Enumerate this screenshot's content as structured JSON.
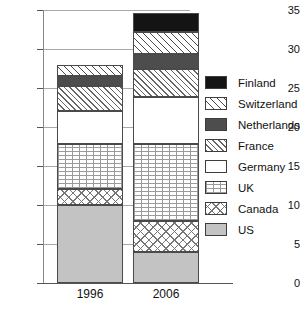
{
  "chart_data": {
    "type": "bar",
    "subtype": "stacked-vertical",
    "title": "",
    "xlabel": "",
    "ylabel": "",
    "categories": [
      "1996",
      "2006"
    ],
    "ylim": [
      0,
      35
    ],
    "yticks": [
      0,
      5,
      10,
      15,
      20,
      25,
      30,
      35
    ],
    "grid": true,
    "legend_position": "right",
    "stack_order_bottom_to_top": [
      "US",
      "Canada",
      "UK",
      "Germany",
      "France",
      "Netherlands",
      "Switzerland",
      "Finland"
    ],
    "series": [
      {
        "name": "US",
        "values": [
          10.0,
          4.0
        ]
      },
      {
        "name": "Canada",
        "values": [
          2.0,
          4.0
        ]
      },
      {
        "name": "UK",
        "values": [
          5.8,
          9.8
        ]
      },
      {
        "name": "Germany",
        "values": [
          4.2,
          6.0
        ]
      },
      {
        "name": "France",
        "values": [
          3.3,
          3.6
        ]
      },
      {
        "name": "Netherlands",
        "values": [
          1.2,
          2.0
        ]
      },
      {
        "name": "Switzerland",
        "values": [
          1.5,
          2.8
        ]
      },
      {
        "name": "Finland",
        "values": [
          0.0,
          2.4
        ]
      }
    ],
    "totals": [
      28.0,
      33.6
    ]
  },
  "axis": {
    "ytick_labels": [
      "35",
      "30",
      "25",
      "20",
      "15",
      "10",
      "5",
      "0"
    ],
    "xtick_labels": [
      "1996",
      "2006"
    ]
  },
  "legend": {
    "entries": [
      {
        "label": "Finland",
        "swatch": "solid-black",
        "color": "#141414"
      },
      {
        "label": "Switzerland",
        "swatch": "thin-diagonal-hatch",
        "color": "#ffffff"
      },
      {
        "label": "Netherlands",
        "swatch": "solid-dark-gray",
        "color": "#4d4d4d"
      },
      {
        "label": "France",
        "swatch": "dense-diagonal-hatch",
        "color": "#ffffff"
      },
      {
        "label": "Germany",
        "swatch": "solid-white",
        "color": "#ffffff"
      },
      {
        "label": "UK",
        "swatch": "fine-dotted-grid",
        "color": "#ffffff"
      },
      {
        "label": "Canada",
        "swatch": "cross-diagonal-hatch",
        "color": "#ffffff"
      },
      {
        "label": "US",
        "swatch": "solid-light-gray",
        "color": "#c3c3c3"
      }
    ]
  }
}
